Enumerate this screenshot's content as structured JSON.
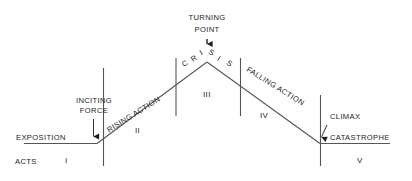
{
  "diagram": {
    "line_color": "#555555",
    "text_color": "#1d1d1d",
    "background": "#ffffff"
  },
  "labels": {
    "exposition": "EXPOSITION",
    "inciting_force_line1": "INCITING",
    "inciting_force_line2": "FORCE",
    "rising_action": "RISING ACTION",
    "turning_point_line1": "TURNING",
    "turning_point_line2": "POINT",
    "crisis": "CRISIS",
    "falling_action": "FALLING ACTION",
    "climax": "CLIMAX",
    "catastrophe": "CATASTROPHE",
    "acts": "ACTS"
  },
  "acts": [
    {
      "numeral": "I"
    },
    {
      "numeral": "II"
    },
    {
      "numeral": "III"
    },
    {
      "numeral": "IV"
    },
    {
      "numeral": "V"
    }
  ],
  "crisis_letters": [
    "C",
    "R",
    "I",
    "S",
    "I",
    "S"
  ]
}
